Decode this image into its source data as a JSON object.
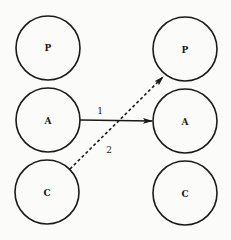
{
  "diagram": {
    "left_nodes": [
      {
        "id": "P",
        "label": "P"
      },
      {
        "id": "A",
        "label": "A"
      },
      {
        "id": "C",
        "label": "C"
      }
    ],
    "right_nodes": [
      {
        "id": "P",
        "label": "P"
      },
      {
        "id": "A",
        "label": "A"
      },
      {
        "id": "C",
        "label": "C"
      }
    ],
    "edges": [
      {
        "from": "left.A",
        "to": "right.A",
        "label": "1",
        "style": "solid"
      },
      {
        "from": "left.C",
        "to": "right.P",
        "label": "2",
        "style": "dashed"
      }
    ],
    "colors": {
      "ink": "#1a1a1a",
      "background": "#fbfbf9"
    }
  }
}
